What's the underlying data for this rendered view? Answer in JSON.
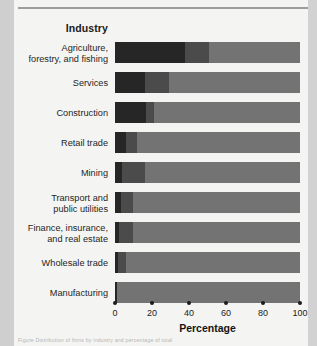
{
  "page": {
    "caption": "Figure  Distribution of firms by industry and percentage of total",
    "background_color": "#f2f2f0"
  },
  "chart_data": {
    "type": "bar",
    "orientation": "horizontal",
    "stacked": true,
    "normalized_percent": true,
    "title": "",
    "column_header": "Industry",
    "xlabel": "Percentage",
    "ylabel": "Industry",
    "xlim": [
      0,
      100
    ],
    "xticks": [
      0,
      20,
      40,
      60,
      80,
      100
    ],
    "xtick_labels": [
      "0",
      "20",
      "40",
      "60",
      "80",
      "100"
    ],
    "grid": false,
    "legend": "none",
    "categories": [
      "Agriculture, forestry, and fishing",
      "Services",
      "Construction",
      "Retail trade",
      "Mining",
      "Transport and public utilities",
      "Finance, insurance, and real estate",
      "Wholesale trade",
      "Manufacturing"
    ],
    "category_lines": [
      [
        "Agriculture,",
        "forestry, and fishing"
      ],
      [
        "Services"
      ],
      [
        "Construction"
      ],
      [
        "Retail trade"
      ],
      [
        "Mining"
      ],
      [
        "Transport and",
        "public utilities"
      ],
      [
        "Finance, insurance,",
        "and real estate"
      ],
      [
        "Wholesale trade"
      ],
      [
        "Manufacturing"
      ]
    ],
    "series": [
      {
        "name": "segment-1",
        "color": "#262626",
        "values": [
          38,
          16,
          17,
          6,
          4,
          3,
          2,
          1.5,
          1
        ]
      },
      {
        "name": "segment-2",
        "color": "#4b4b4b",
        "values": [
          13,
          13,
          4,
          6,
          12,
          7,
          8,
          4.5,
          0
        ]
      },
      {
        "name": "segment-3",
        "color": "#737373",
        "values": [
          49,
          71,
          79,
          88,
          84,
          90,
          90,
          94,
          99
        ]
      }
    ]
  }
}
